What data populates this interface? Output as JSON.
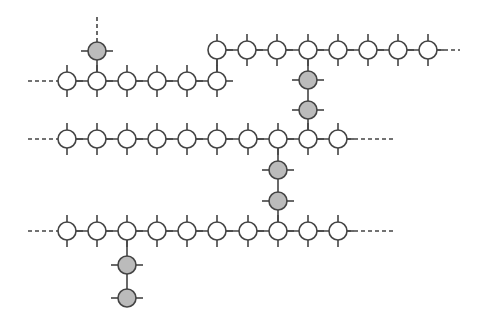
{
  "diagram": {
    "type": "molecular-chain",
    "colors": {
      "line": "#444444",
      "node_open": "#ffffff",
      "node_filled": "#bbbbbb"
    },
    "node_radius": 9,
    "rows": [
      {
        "name": "row-0",
        "y": 50,
        "xs": [
          217,
          247,
          277,
          308,
          338,
          368,
          398,
          428
        ],
        "dash_left": null,
        "dash_right": 460
      },
      {
        "name": "row-1",
        "y": 81,
        "xs": [
          67,
          97,
          127,
          157,
          187,
          217
        ],
        "dash_left": 28,
        "dash_right": null
      },
      {
        "name": "row-2",
        "y": 139,
        "xs": [
          67,
          97,
          127,
          157,
          187,
          217,
          248,
          278,
          308,
          338
        ],
        "dash_left": 28,
        "dash_right": 396
      },
      {
        "name": "row-3",
        "y": 231,
        "xs": [
          67,
          97,
          127,
          157,
          187,
          217,
          248,
          278,
          308,
          338
        ],
        "dash_left": 28,
        "dash_right": 396
      }
    ],
    "branches": [
      {
        "name": "branch-top-left",
        "x": 97,
        "from_y": 81,
        "filled_ys": [
          51
        ],
        "dash_to": 15
      },
      {
        "name": "branch-row0-row1",
        "x": 217,
        "from_y": 50,
        "to_y": 81,
        "filled_ys": []
      },
      {
        "name": "branch-row0-row2",
        "x": 308,
        "from_y": 50,
        "to_y": 139,
        "filled_ys": [
          80,
          110
        ]
      },
      {
        "name": "branch-row2-row3",
        "x": 278,
        "from_y": 139,
        "to_y": 231,
        "filled_ys": [
          170,
          201
        ]
      },
      {
        "name": "branch-bottom",
        "x": 127,
        "from_y": 231,
        "to_y": 298,
        "filled_ys": [
          265,
          298
        ]
      }
    ]
  }
}
